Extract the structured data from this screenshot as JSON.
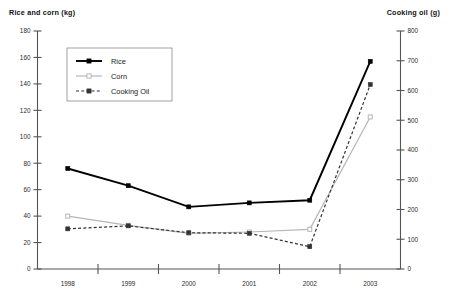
{
  "chart_data": {
    "type": "line",
    "title": "",
    "categories": [
      "1998",
      "1999",
      "2000",
      "2001",
      "2002",
      "2003"
    ],
    "xlabel": "",
    "axes": {
      "left": {
        "label": "Rice and corn (kg)",
        "ylim": [
          0,
          180
        ],
        "ticks": [
          0,
          20,
          40,
          60,
          80,
          100,
          120,
          140,
          160,
          180
        ],
        "tick_labels": [
          "0",
          "20",
          "40",
          "60",
          "80",
          "100",
          "120",
          "140",
          "160",
          "180"
        ]
      },
      "right": {
        "label": "Cooking oil (g)",
        "ylim": [
          0,
          800
        ],
        "ticks": [
          0,
          100,
          200,
          300,
          400,
          500,
          600,
          700,
          800
        ],
        "tick_labels": [
          "0",
          "100",
          "200",
          "300",
          "400",
          "500",
          "600",
          "700",
          "800"
        ]
      }
    },
    "grid": false,
    "legend_position": "top-left",
    "series": [
      {
        "name": "Rice",
        "axis": "left",
        "unit": "kg",
        "color": "#000000",
        "line_style": "solid",
        "marker": "filled-square",
        "values": [
          76,
          63,
          47,
          50,
          52,
          157
        ]
      },
      {
        "name": "Corn",
        "axis": "left",
        "unit": "kg",
        "color": "#b6b6b6",
        "line_style": "solid",
        "marker": "open-square",
        "values": [
          40,
          33,
          27,
          28,
          30,
          115
        ]
      },
      {
        "name": "Cooking Oil",
        "axis": "right",
        "unit": "g",
        "color": "#333333",
        "line_style": "dashed",
        "marker": "filled-square",
        "values": [
          135,
          145,
          122,
          120,
          75,
          620
        ]
      }
    ]
  },
  "legend": {
    "entries": [
      {
        "label": "Rice"
      },
      {
        "label": "Corn"
      },
      {
        "label": "Cooking Oil"
      }
    ]
  }
}
